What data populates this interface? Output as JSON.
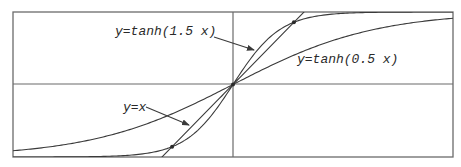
{
  "chart_data": {
    "type": "line",
    "title": "",
    "xlabel": "",
    "ylabel": "",
    "xlim": [
      -3.1,
      3.1
    ],
    "ylim": [
      -1.0,
      1.0
    ],
    "grid": false,
    "axes_through_origin": true,
    "series": [
      {
        "name": "y=tanh(1.5 x)",
        "function": "tanh",
        "k": 1.5
      },
      {
        "name": "y=tanh(0.5 x)",
        "function": "tanh",
        "k": 0.5
      },
      {
        "name": "y=x",
        "function": "linear",
        "k": 1.0
      }
    ],
    "intersection_points": [
      {
        "x": 0.858,
        "y": 0.858
      },
      {
        "x": 0,
        "y": 0
      },
      {
        "x": -0.858,
        "y": -0.858
      }
    ],
    "annotations": [
      {
        "text": "y=tanh(1.5 x)",
        "label_x": 115,
        "label_y": 35,
        "arrow_from": [
          214,
          37
        ],
        "arrow_to": [
          254,
          50
        ]
      },
      {
        "text": "y=tanh(0.5 x)",
        "label_x": 297,
        "label_y": 63,
        "arrow_from": null,
        "arrow_to": null
      },
      {
        "text": "y=x",
        "label_x": 123,
        "label_y": 111,
        "arrow_from": [
          146,
          107
        ],
        "arrow_to": [
          189,
          125
        ]
      }
    ]
  },
  "labels": {
    "tanh15": "y=tanh(1.5 x)",
    "tanh05": "y=tanh(0.5 x)",
    "identity": "y=x"
  }
}
